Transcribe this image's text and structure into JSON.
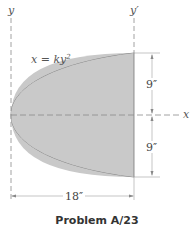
{
  "figure": {
    "axis_labels": {
      "y": "y",
      "y_prime": "y′",
      "x": "x"
    },
    "equation": {
      "lhs": "x = ky",
      "exponent": "2"
    },
    "dimensions": {
      "upper_height": "9″",
      "lower_height": "9″",
      "width": "18″"
    },
    "colors": {
      "fill": "#c9c9c9",
      "stroke": "#777777",
      "dash": "#8a8a8a"
    }
  },
  "caption": "Problem A/23"
}
